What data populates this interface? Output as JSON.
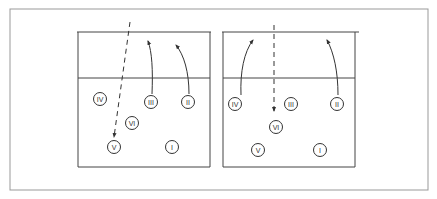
{
  "diagram": {
    "type": "volleyball-rotation",
    "colors": {
      "line": "#333333",
      "frame": "#888888",
      "background": "#ffffff"
    },
    "courts": [
      {
        "id": "left",
        "players": [
          {
            "label": "IV",
            "x": 100,
            "y": 99
          },
          {
            "label": "III",
            "x": 151,
            "y": 102
          },
          {
            "label": "II",
            "x": 188,
            "y": 102
          },
          {
            "label": "VI",
            "x": 132,
            "y": 123
          },
          {
            "label": "V",
            "x": 114,
            "y": 147
          },
          {
            "label": "I",
            "x": 172,
            "y": 147
          }
        ],
        "moves": [
          {
            "from": "III",
            "style": "solid-arrow"
          },
          {
            "from": "II",
            "style": "solid-arrow"
          },
          {
            "to": "V",
            "style": "dashed-arrow"
          }
        ]
      },
      {
        "id": "right",
        "players": [
          {
            "label": "IV",
            "x": 235,
            "y": 104
          },
          {
            "label": "III",
            "x": 291,
            "y": 104
          },
          {
            "label": "II",
            "x": 337,
            "y": 104
          },
          {
            "label": "VI",
            "x": 276,
            "y": 127
          },
          {
            "label": "V",
            "x": 258,
            "y": 150
          },
          {
            "label": "I",
            "x": 320,
            "y": 150
          }
        ],
        "moves": [
          {
            "from": "IV",
            "style": "solid-arrow"
          },
          {
            "from": "II",
            "style": "solid-arrow"
          },
          {
            "to": "VI",
            "style": "dashed-arrow"
          }
        ]
      }
    ]
  }
}
